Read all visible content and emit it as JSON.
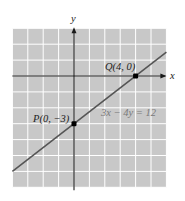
{
  "chart_data": {
    "type": "line",
    "title": "",
    "xlabel": "x",
    "ylabel": "y",
    "xlim": [
      -4,
      6
    ],
    "ylim": [
      -7,
      3
    ],
    "grid": true,
    "legend": null,
    "series": [
      {
        "name": "3x − 4y = 12",
        "equation": "3x − 4y = 12",
        "x": [
          -4,
          6
        ],
        "y": [
          -6,
          1.5
        ]
      }
    ],
    "points": [
      {
        "label": "P(0, −3)",
        "x": 0,
        "y": -3
      },
      {
        "label": "Q(4, 0)",
        "x": 4,
        "y": 0
      }
    ],
    "annotations": [
      {
        "text": "3x − 4y = 12",
        "x": 1.7,
        "y": -2.3
      }
    ]
  },
  "axes": {
    "x_label": "x",
    "y_label": "y"
  },
  "labels": {
    "point_p": "P(0, −3)",
    "point_q": "Q(4, 0)",
    "equation": "3x − 4y = 12"
  },
  "colors": {
    "grid_fill": "#c8c8c8",
    "grid_lines": "#ffffff",
    "axes": "#1a1a1a",
    "line": "#555555",
    "points": "#000000",
    "equation_text": "#7a7a7a"
  }
}
